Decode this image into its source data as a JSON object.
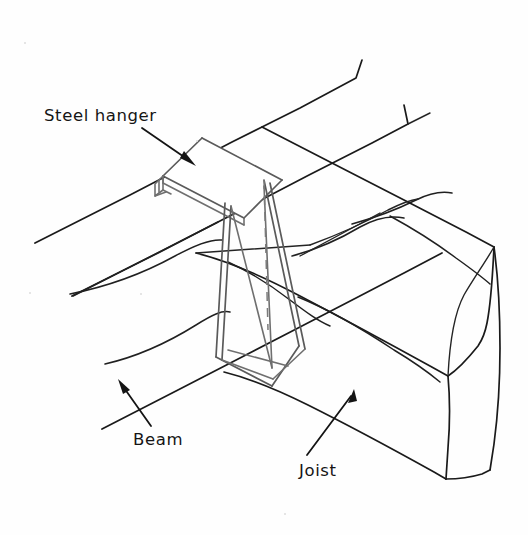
{
  "figure": {
    "background_color": "#fefefe",
    "line_color": "#1a1a1a",
    "metal_color": "#6f6f6f",
    "width": 528,
    "height": 535
  },
  "labels": {
    "steel_hanger": "Steel hanger",
    "beam": "Beam",
    "joist": "Joist"
  },
  "annotations": [
    {
      "id": "steel-hanger",
      "text": "Steel hanger",
      "text_x": 44,
      "text_y": 106,
      "leader_from": [
        142,
        128
      ],
      "leader_to": [
        193,
        164
      ],
      "points_at": "hanger-top-flange"
    },
    {
      "id": "beam",
      "text": "Beam",
      "text_x": 133,
      "text_y": 430,
      "leader_from": [
        150,
        426
      ],
      "leader_to": [
        120,
        384
      ],
      "points_at": "beam-side-face"
    },
    {
      "id": "joist",
      "text": "Joist",
      "text_x": 299,
      "text_y": 461,
      "leader_from": [
        308,
        455
      ],
      "leader_to": [
        350,
        394
      ],
      "points_at": "joist-side-face"
    }
  ],
  "parts": [
    {
      "name": "beam",
      "material": "timber",
      "description": "Horizontal support beam running from lower-left to upper-right in isometric view, drawn in freehand line work with grain lines."
    },
    {
      "name": "joist",
      "material": "timber",
      "description": "Timber joist running from upper-left to lower-right, terminating in a visible cut end block at the right."
    },
    {
      "name": "steel-hanger",
      "material": "steel",
      "description": "U-shaped steel stirrup hanger with a top flange seated over the beam and a saddle strap supporting the joist end."
    }
  ]
}
